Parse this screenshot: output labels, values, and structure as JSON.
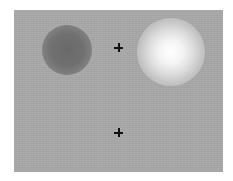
{
  "stimulus": {
    "background_color": "#a9a9a9",
    "blobs": [
      {
        "name": "dark-blob",
        "center": [
          67,
          50
        ],
        "radius": 24,
        "color": "#6a6a6a"
      },
      {
        "name": "bright-blob",
        "center": [
          171,
          52
        ],
        "radius": 30,
        "color": "#ffffff"
      }
    ],
    "fixation_crosses": [
      {
        "name": "upper-fixation-cross",
        "center": [
          119,
          48
        ]
      },
      {
        "name": "lower-fixation-cross",
        "center": [
          119,
          133
        ]
      }
    ]
  }
}
